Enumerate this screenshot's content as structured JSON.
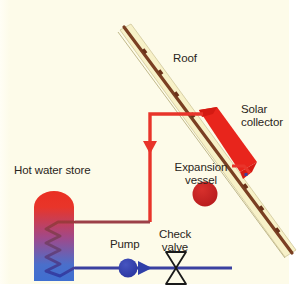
{
  "diagram": {
    "background_color": "#fdfbe9",
    "labels": {
      "roof": "Roof",
      "solar_collector_line1": "Solar",
      "solar_collector_line2": "collector",
      "hot_water_store": "Hot water store",
      "expansion_vessel_line1": "Expansion",
      "expansion_vessel_line2": "vessel",
      "pump": "Pump",
      "check_valve_line1": "Check",
      "check_valve_line2": "valve"
    },
    "colors": {
      "background": "#fdfbe9",
      "roof_band": "#f7f1c8",
      "roof_tiles": "#7a3f22",
      "collector_red": "#e8251c",
      "hot_pipe": "#e8342a",
      "warm_pipe": "#9c4048",
      "cold_pipe": "#3a40a0",
      "pump_blue": "#2f3fa8",
      "vessel_red": "#c41f20",
      "store_hot": "#e8352a",
      "store_cold": "#3f6fd0",
      "valve_outline": "#1a1a1a",
      "text": "#2a2520"
    },
    "components": [
      {
        "name": "roof",
        "type": "pitched-roof-band"
      },
      {
        "name": "solar-collector",
        "type": "flat-plate-collector"
      },
      {
        "name": "hot-water-store",
        "type": "cylinder-with-coil"
      },
      {
        "name": "expansion-vessel",
        "type": "circular-vessel"
      },
      {
        "name": "pump",
        "type": "circulator-pump"
      },
      {
        "name": "check-valve",
        "type": "non-return-valve"
      },
      {
        "name": "flow-pipe-hot",
        "type": "pipe"
      },
      {
        "name": "return-pipe-cold",
        "type": "pipe"
      }
    ]
  }
}
